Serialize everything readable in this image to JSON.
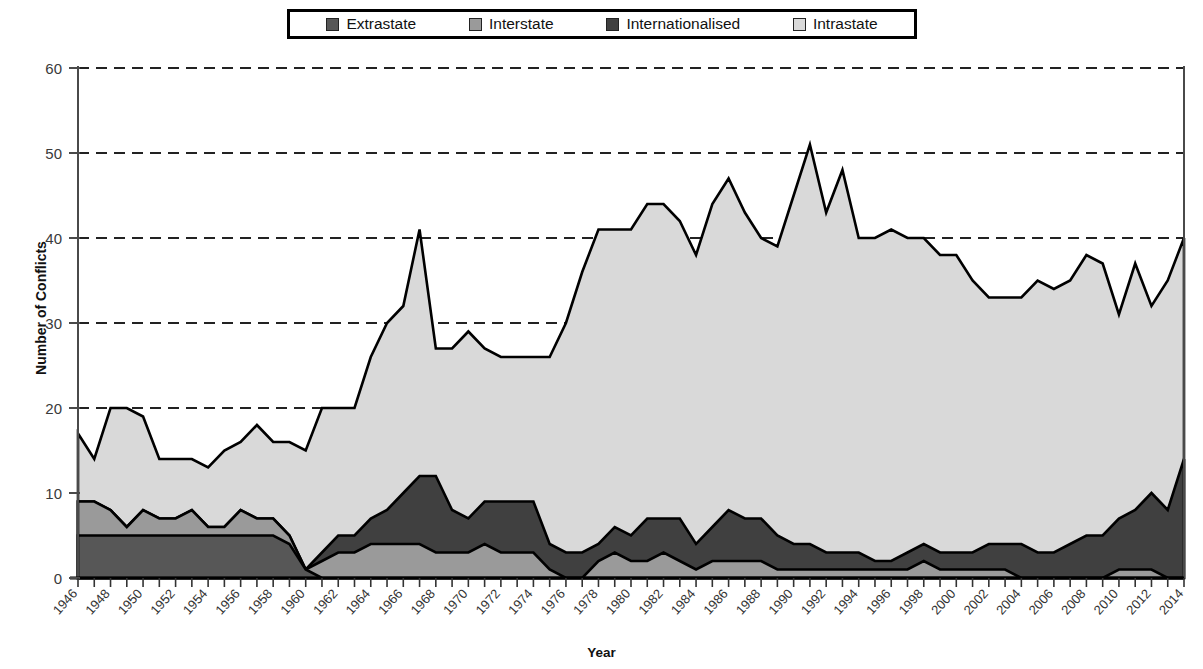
{
  "legend": {
    "items": [
      {
        "label": "Extrastate",
        "color": "#575757"
      },
      {
        "label": "Interstate",
        "color": "#9a9a9a"
      },
      {
        "label": "Internationalised",
        "color": "#404040"
      },
      {
        "label": "Intrastate",
        "color": "#d9d9d9"
      }
    ]
  },
  "axes": {
    "ylabel": "Number of Conflicts",
    "xlabel": "Year",
    "yticks": [
      "0",
      "10",
      "20",
      "30",
      "40",
      "50",
      "60"
    ]
  },
  "chart_data": {
    "type": "area",
    "stacked": true,
    "title": "",
    "xlabel": "Year",
    "ylabel": "Number of Conflicts",
    "ylim": [
      0,
      60
    ],
    "xlim": [
      1946,
      2014
    ],
    "grid": "horizontal-dashed",
    "legend_position": "top-center",
    "x": [
      1946,
      1947,
      1948,
      1949,
      1950,
      1951,
      1952,
      1953,
      1954,
      1955,
      1956,
      1957,
      1958,
      1959,
      1960,
      1961,
      1962,
      1963,
      1964,
      1965,
      1966,
      1967,
      1968,
      1969,
      1970,
      1971,
      1972,
      1973,
      1974,
      1975,
      1976,
      1977,
      1978,
      1979,
      1980,
      1981,
      1982,
      1983,
      1984,
      1985,
      1986,
      1987,
      1988,
      1989,
      1990,
      1991,
      1992,
      1993,
      1994,
      1995,
      1996,
      1997,
      1998,
      1999,
      2000,
      2001,
      2002,
      2003,
      2004,
      2005,
      2006,
      2007,
      2008,
      2009,
      2010,
      2011,
      2012,
      2013,
      2014
    ],
    "series": [
      {
        "name": "Extrastate",
        "color": "#575757",
        "values": [
          5,
          5,
          5,
          5,
          5,
          5,
          5,
          5,
          5,
          5,
          5,
          5,
          5,
          4,
          1,
          0,
          0,
          0,
          0,
          0,
          0,
          0,
          0,
          0,
          0,
          0,
          0,
          0,
          0,
          0,
          0,
          0,
          0,
          0,
          0,
          0,
          0,
          0,
          0,
          0,
          0,
          0,
          0,
          0,
          0,
          0,
          0,
          0,
          0,
          0,
          0,
          0,
          0,
          0,
          0,
          0,
          0,
          0,
          0,
          0,
          0,
          0,
          0,
          0,
          0,
          0,
          0,
          0,
          0
        ]
      },
      {
        "name": "Interstate",
        "color": "#9a9a9a",
        "values": [
          4,
          4,
          3,
          1,
          3,
          2,
          2,
          3,
          1,
          1,
          3,
          2,
          2,
          1,
          0,
          2,
          3,
          3,
          4,
          4,
          4,
          4,
          3,
          3,
          3,
          4,
          3,
          3,
          3,
          1,
          0,
          0,
          2,
          3,
          2,
          2,
          3,
          2,
          1,
          2,
          2,
          2,
          2,
          1,
          1,
          1,
          1,
          1,
          1,
          1,
          1,
          1,
          2,
          1,
          1,
          1,
          1,
          1,
          0,
          0,
          0,
          0,
          0,
          0,
          1,
          1,
          1,
          0,
          0
        ]
      },
      {
        "name": "Internationalised",
        "color": "#404040",
        "values": [
          0,
          0,
          0,
          0,
          0,
          0,
          0,
          0,
          0,
          0,
          0,
          0,
          0,
          0,
          0,
          1,
          2,
          2,
          3,
          4,
          6,
          8,
          9,
          5,
          4,
          5,
          6,
          6,
          6,
          3,
          3,
          3,
          2,
          3,
          3,
          5,
          4,
          5,
          3,
          4,
          6,
          5,
          5,
          4,
          3,
          3,
          2,
          2,
          2,
          1,
          1,
          2,
          2,
          2,
          2,
          2,
          3,
          3,
          4,
          3,
          3,
          4,
          5,
          5,
          6,
          7,
          9,
          8,
          14
        ]
      },
      {
        "name": "Intrastate",
        "color": "#d9d9d9",
        "values": [
          8,
          5,
          12,
          14,
          11,
          7,
          7,
          6,
          7,
          9,
          8,
          11,
          9,
          11,
          14,
          17,
          15,
          15,
          19,
          22,
          22,
          29,
          15,
          19,
          22,
          18,
          17,
          17,
          17,
          22,
          27,
          33,
          37,
          35,
          36,
          37,
          37,
          35,
          34,
          38,
          39,
          36,
          33,
          34,
          41,
          47,
          40,
          45,
          37,
          38,
          39,
          37,
          36,
          35,
          35,
          32,
          29,
          29,
          29,
          32,
          31,
          31,
          33,
          32,
          24,
          29,
          22,
          27,
          26
        ]
      }
    ],
    "totals": [
      17,
      14,
      20,
      20,
      19,
      14,
      14,
      14,
      13,
      15,
      16,
      18,
      16,
      16,
      15,
      20,
      20,
      20,
      26,
      30,
      32,
      33,
      27,
      27,
      29,
      27,
      26,
      26,
      26,
      26,
      30,
      36,
      41,
      41,
      41,
      44,
      44,
      42,
      38,
      44,
      47,
      43,
      40,
      39,
      45,
      51,
      43,
      48,
      40,
      40,
      41,
      40,
      40,
      38,
      38,
      35,
      33,
      33,
      33,
      35,
      34,
      35,
      38,
      37,
      31,
      37,
      32,
      35,
      40
    ]
  }
}
